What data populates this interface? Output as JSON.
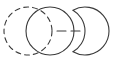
{
  "figure": {
    "type": "diagram",
    "title": "Two overlapping circles linked by a dashed segment to a crescent",
    "canvas": {
      "width": 118,
      "height": 62,
      "background": "#ffffff"
    },
    "stroke": {
      "color": "#3a3a3a",
      "width": 1.1
    },
    "shapes": [
      {
        "id": "dashed-circle",
        "kind": "circle",
        "label": "Dashed outline circle (left)",
        "cx": 28,
        "cy": 31,
        "r": 24,
        "stroke_style": "dashed",
        "dash_pattern": "5 4",
        "fill": "none"
      },
      {
        "id": "solid-circle",
        "kind": "circle",
        "label": "Solid outline circle (middle, overlapping)",
        "cx": 50,
        "cy": 31,
        "r": 24,
        "stroke_style": "solid",
        "dash_pattern": "none",
        "fill": "none"
      },
      {
        "id": "connector",
        "kind": "line",
        "label": "Dashed horizontal connector",
        "x1": 57,
        "y1": 31,
        "x2": 81,
        "y2": 31,
        "stroke_style": "dashed",
        "dash_pattern": "9 5",
        "fill": "none"
      },
      {
        "id": "crescent",
        "kind": "crescent",
        "label": "Crescent moon opening to the left",
        "cx": 85,
        "cy": 31,
        "r": 24,
        "notch_cx": 61,
        "notch_cy": 31,
        "notch_r": 24,
        "stroke_style": "solid",
        "dash_pattern": "none",
        "fill": "none"
      }
    ]
  }
}
